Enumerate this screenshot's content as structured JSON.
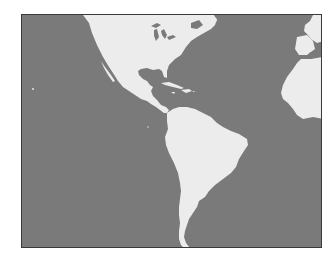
{
  "map": {
    "type": "grayscale world map excerpt",
    "regions": [
      "North America",
      "Central America",
      "Caribbean",
      "South America",
      "Western Europe",
      "West Africa"
    ],
    "colors": {
      "ocean": "#7a7a7a",
      "land": "#ececec",
      "border": "#3a3a3a",
      "background": "#ffffff"
    }
  }
}
